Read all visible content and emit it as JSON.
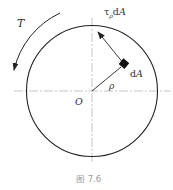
{
  "figure": {
    "caption": "图 7.6",
    "labels": {
      "torque": "T",
      "shear_force": "τ",
      "shear_force_sub": "ρ",
      "shear_force_tail": "dA",
      "area_element": "dA",
      "radius": "ρ",
      "center": "O"
    },
    "geometry": {
      "center": [
        92,
        91
      ],
      "radius": 65,
      "element_position": [
        124,
        64
      ],
      "arrow_tip": [
        98,
        32
      ],
      "torque_arc_radius": 82
    },
    "colors": {
      "line": "#222222",
      "centerline": "#b0b0b0",
      "caption": "#9a9a9a"
    }
  }
}
